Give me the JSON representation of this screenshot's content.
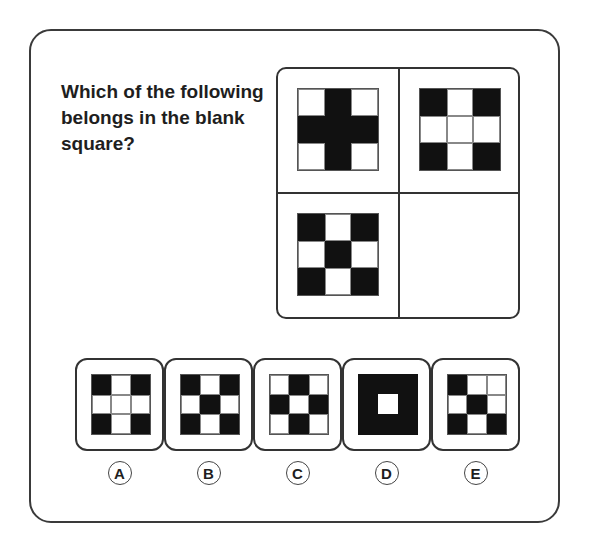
{
  "question": "Which of the following belongs in the blank square?",
  "grid": {
    "cells": [
      {
        "position": "top-left",
        "pattern": [
          "w",
          "b",
          "w",
          "b",
          "b",
          "b",
          "w",
          "b",
          "w"
        ]
      },
      {
        "position": "top-right",
        "pattern": [
          "b",
          "w",
          "b",
          "w",
          "w",
          "w",
          "b",
          "w",
          "b"
        ]
      },
      {
        "position": "bottom-left",
        "pattern": [
          "b",
          "w",
          "b",
          "w",
          "b",
          "w",
          "b",
          "w",
          "b"
        ]
      },
      {
        "position": "bottom-right",
        "pattern": null,
        "blank": true
      }
    ]
  },
  "options": [
    {
      "label": "A",
      "pattern": [
        "b",
        "w",
        "b",
        "w",
        "w",
        "w",
        "b",
        "w",
        "b"
      ]
    },
    {
      "label": "B",
      "pattern": [
        "b",
        "w",
        "b",
        "w",
        "b",
        "w",
        "b",
        "w",
        "b"
      ]
    },
    {
      "label": "C",
      "pattern": [
        "w",
        "b",
        "w",
        "b",
        "w",
        "b",
        "w",
        "b",
        "w"
      ]
    },
    {
      "label": "D",
      "pattern": "solid-with-center-hole"
    },
    {
      "label": "E",
      "pattern": [
        "b",
        "w",
        "w",
        "w",
        "b",
        "w",
        "b",
        "w",
        "b"
      ]
    }
  ],
  "colors": {
    "fill": "#111111",
    "line": "#333333",
    "background": "#ffffff"
  }
}
